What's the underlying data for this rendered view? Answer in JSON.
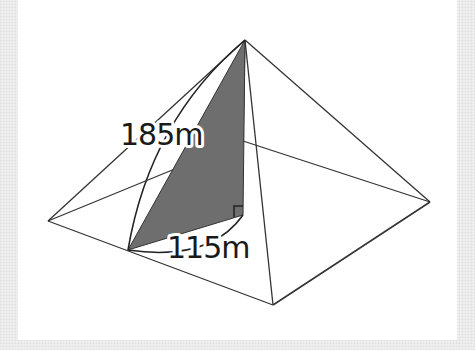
{
  "figure": {
    "colors": {
      "background": "#f0f0f0",
      "panel": "#ffffff",
      "edge": "#333333",
      "shaded_face": "#6e6e6e"
    },
    "labels": {
      "slant_height": "185m",
      "half_base": "115m"
    },
    "vertices": {
      "apex": [
        245,
        40
      ],
      "left_corner": [
        48,
        221
      ],
      "right_corner": [
        430,
        202
      ],
      "front_corner": [
        273,
        305
      ],
      "back_corner": [
        243,
        141
      ],
      "base_center": [
        243,
        215
      ],
      "edge_midpoint": [
        128,
        250
      ]
    }
  }
}
